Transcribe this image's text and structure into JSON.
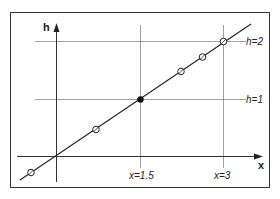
{
  "diagram": {
    "axes": {
      "x_label": "x",
      "y_label": "h"
    },
    "horizontal_guides": [
      {
        "label": "h=2"
      },
      {
        "label": "h=1"
      }
    ],
    "vertical_guides": [
      {
        "label": "x=1.5"
      },
      {
        "label": "x=3"
      }
    ],
    "line": {
      "description": "straight line through origin"
    },
    "points": [
      {
        "type": "open"
      },
      {
        "type": "open"
      },
      {
        "type": "filled"
      },
      {
        "type": "open"
      },
      {
        "type": "open"
      },
      {
        "type": "open"
      }
    ],
    "colors": {
      "line": "#222222",
      "grid": "#888888",
      "frame": "#333333"
    }
  }
}
